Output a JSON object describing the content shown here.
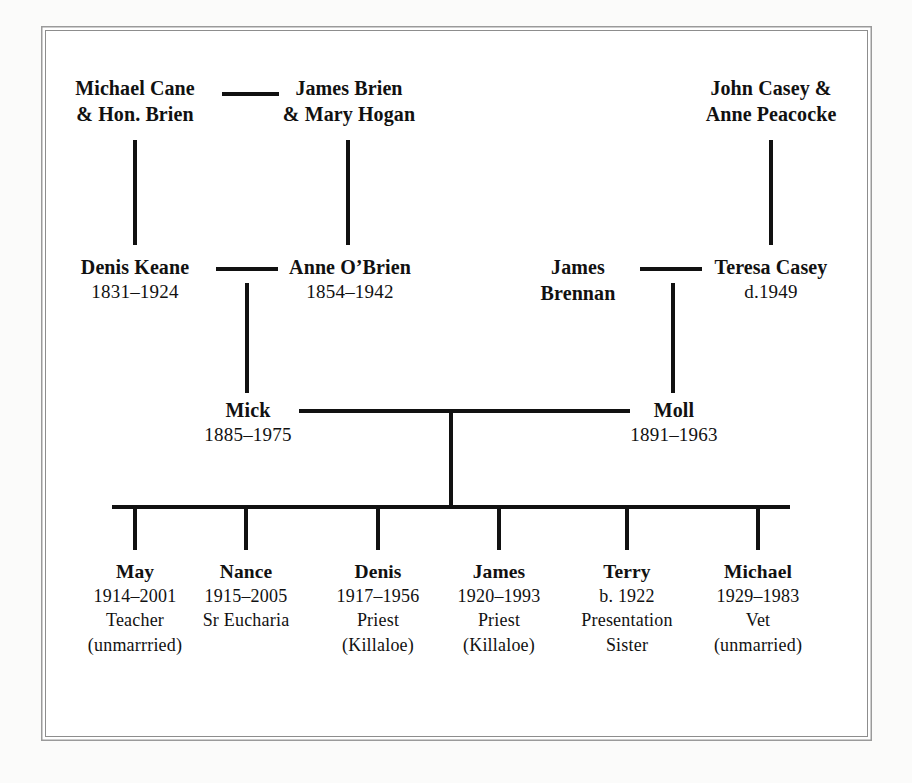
{
  "diagram": {
    "ink_color": "#111111",
    "frame_color": "#8d8d8d",
    "background": "#ffffff"
  },
  "generation1": {
    "cane_brien": {
      "line1": "Michael Cane",
      "line2": "& Hon. Brien"
    },
    "brien_hogan": {
      "line1": "James Brien",
      "line2": "& Mary Hogan"
    },
    "casey_peacocke": {
      "line1": "John Casey &",
      "line2": "Anne Peacocke"
    }
  },
  "generation2": {
    "denis_keane": {
      "name": "Denis Keane",
      "dates": "1831–1924"
    },
    "anne_obrien": {
      "name": "Anne O’Brien",
      "dates": "1854–1942"
    },
    "james_brennan": {
      "line1": "James",
      "line2": "Brennan"
    },
    "teresa_casey": {
      "name": "Teresa Casey",
      "dates": "d.1949"
    }
  },
  "generation3": {
    "mick": {
      "name": "Mick",
      "dates": "1885–1975"
    },
    "moll": {
      "name": "Moll",
      "dates": "1891–1963"
    }
  },
  "children": [
    {
      "name": "May",
      "dates": "1914–2001",
      "occupation": "Teacher",
      "note": "(unmarrried)"
    },
    {
      "name": "Nance",
      "dates": "1915–2005",
      "occupation": "Sr Eucharia",
      "note": ""
    },
    {
      "name": "Denis",
      "dates": "1917–1956",
      "occupation": "Priest",
      "note": "(Killaloe)"
    },
    {
      "name": "James",
      "dates": "1920–1993",
      "occupation": "Priest",
      "note": "(Killaloe)"
    },
    {
      "name": "Terry",
      "dates": "b. 1922",
      "occupation": "Presentation",
      "note": "Sister"
    },
    {
      "name": "Michael",
      "dates": "1929–1983",
      "occupation": "Vet",
      "note": "(unmarried)"
    }
  ]
}
